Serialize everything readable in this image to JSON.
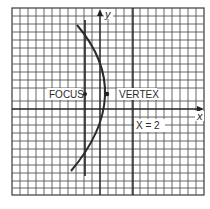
{
  "diagram": {
    "type": "parabola-on-grid",
    "axes": {
      "x_label": "x",
      "y_label": "y"
    },
    "labels": {
      "focus": "FOCUS",
      "vertex": "VERTEX",
      "line_equation": "X = 2"
    },
    "colors": {
      "grid": "#3a3a3a",
      "axes": "#333333",
      "curve": "#2b2b2b",
      "background": "#ffffff"
    }
  }
}
